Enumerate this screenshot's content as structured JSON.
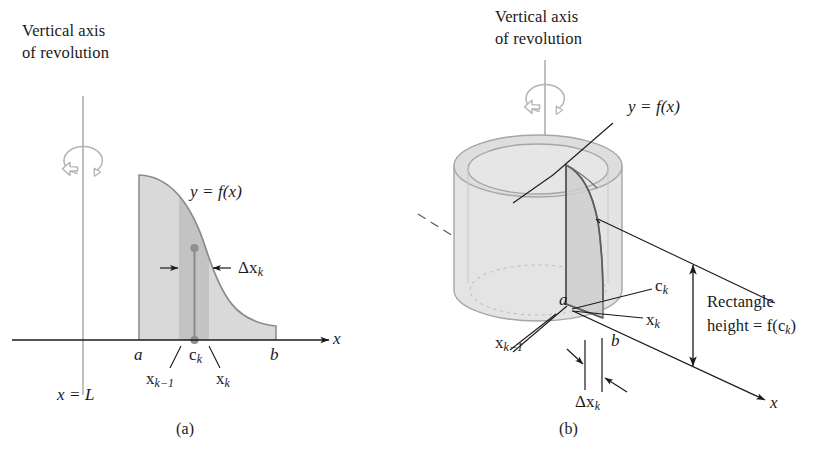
{
  "figure": {
    "kind": "calculus-shell-method-diagram",
    "caption_a": "(a)",
    "caption_b": "(b)"
  },
  "panel_a": {
    "axis_title_line1": "Vertical axis",
    "axis_title_line2": "of revolution",
    "curve_label": "y = f(x)",
    "delta_label_delta": "Δ",
    "delta_label_x": "x",
    "delta_label_sub": "k",
    "axis_x_label": "x",
    "tick_a": "a",
    "tick_b": "b",
    "tick_ck_base": "c",
    "tick_ck_sub": "k",
    "tick_xkm1_base": "x",
    "tick_xkm1_sub": "k−1",
    "tick_xk_base": "x",
    "tick_xk_sub": "k",
    "vertical_line_label": "x = L",
    "arrow_left_glyph": "→",
    "arrow_right_glyph": "←"
  },
  "panel_b": {
    "axis_title_line1": "Vertical axis",
    "axis_title_line2": "of revolution",
    "curve_label": "y = f(x)",
    "label_a": "a",
    "label_b": "b",
    "label_ck_base": "c",
    "label_ck_sub": "k",
    "label_xk_base": "x",
    "label_xk_sub": "k",
    "label_xkm1_base": "x",
    "label_xkm1_sub": "k−1",
    "delta_label_delta": "Δ",
    "delta_label_x": "x",
    "delta_label_sub": "k",
    "axis_x_label": "x",
    "height_line1": "Rectangle",
    "height_line2_prefix": "height = f(c",
    "height_line2_sub": "k",
    "height_line2_suffix": ")"
  },
  "colors": {
    "ink": "#1a1a1a",
    "outline": "#6e6e6e",
    "region_fill": "#d8d8d8",
    "strip_fill": "#c2c2c2",
    "cylinder_fill": "#e2e2e2",
    "cylinder_top": "#dcdcdc",
    "cylinder_edge": "#9a9a9a",
    "shell_fill": "#cfcfcf",
    "axis_line": "#8c8c8c",
    "dot": "#8a8a8a"
  }
}
